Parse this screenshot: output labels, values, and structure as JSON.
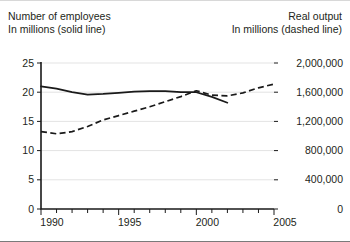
{
  "header": {
    "left_line1": "Number of employees",
    "left_line2": "In millions (solid line)",
    "right_line1": "Real output",
    "right_line2": "In millions (dashed line)"
  },
  "chart_data": {
    "type": "line",
    "title": "",
    "xlabel": "",
    "ylabel": "Number of employees, In millions (solid line)",
    "y2label": "Real output, In millions (dashed line)",
    "xlim": [
      1990,
      2005
    ],
    "ylim": [
      0,
      25
    ],
    "y2lim": [
      0,
      2000000
    ],
    "xticks": [
      1990,
      1991,
      1992,
      1993,
      1994,
      1995,
      1996,
      1997,
      1998,
      1999,
      2000,
      2001,
      2002,
      2003,
      2004,
      2005
    ],
    "xticklabels": [
      "1990",
      "",
      "",
      "",
      "",
      "1995",
      "",
      "",
      "",
      "",
      "2000",
      "",
      "",
      "",
      "",
      "2005"
    ],
    "yticks": [
      0,
      5,
      10,
      15,
      20,
      25
    ],
    "yticklabels": [
      "0",
      "5",
      "10",
      "15",
      "20",
      "25"
    ],
    "y2ticks": [
      0,
      400000,
      800000,
      1200000,
      1600000,
      2000000
    ],
    "y2ticklabels": [
      "0",
      "400,000",
      "800,000",
      "1,200,000",
      "1,600,000",
      "2,000,000"
    ],
    "grid": true,
    "legend": "none",
    "line_color": "#1a1a1a",
    "grid_color": "#e3e3e3",
    "series": [
      {
        "name": "Number of employees",
        "style": "solid",
        "axis": "left",
        "units": "millions",
        "x": [
          1990,
          1991,
          1992,
          1993,
          1994,
          1995,
          1996,
          1997,
          1998,
          1999,
          2000,
          2001,
          2002
        ],
        "values": [
          21.0,
          20.6,
          20.0,
          19.6,
          19.7,
          19.9,
          20.1,
          20.2,
          20.2,
          20.0,
          20.0,
          19.2,
          18.2
        ]
      },
      {
        "name": "Real output",
        "style": "dashed",
        "axis": "right",
        "units": "millions",
        "x": [
          1990,
          1991,
          1992,
          1993,
          1994,
          1995,
          1996,
          1997,
          1998,
          1999,
          2000,
          2001,
          2002,
          2003,
          2004,
          2005
        ],
        "values": [
          1060000,
          1030000,
          1060000,
          1130000,
          1220000,
          1280000,
          1340000,
          1400000,
          1470000,
          1540000,
          1620000,
          1560000,
          1550000,
          1590000,
          1660000,
          1710000
        ]
      }
    ]
  }
}
